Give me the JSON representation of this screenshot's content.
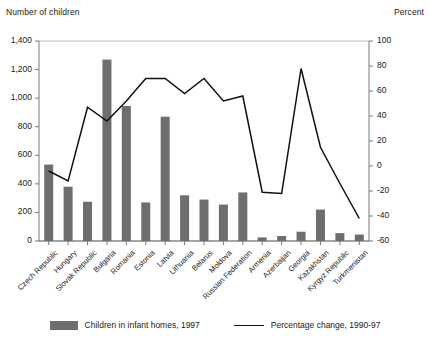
{
  "chart_data": {
    "type": "bar",
    "title": "",
    "subtitle": "",
    "ylabel": "Number of children",
    "y2label": "Percent",
    "xlabel": "",
    "grid": false,
    "legend_position": "bottom",
    "categories": [
      "Czech Republic",
      "Hungary",
      "Slovak Republic",
      "Bulgaria",
      "Romania",
      "Estonia",
      "Latvia",
      "Lithuania",
      "Belarus",
      "Moldova",
      "Russian Federation",
      "Armenia",
      "Azerbaijan",
      "Georgia",
      "Kazakhstan",
      "Kyrgyz Republic",
      "Turkmenistan"
    ],
    "ylim": [
      0,
      1400
    ],
    "yticks": [
      "0",
      "200",
      "400",
      "600",
      "800",
      "1,000",
      "1,200",
      "1,400"
    ],
    "y2lim": [
      -60,
      100
    ],
    "y2ticks": [
      "-60",
      "-40",
      "-20",
      "0",
      "20",
      "40",
      "60",
      "80",
      "100"
    ],
    "series": [
      {
        "name": "Children in infant homes, 1997",
        "type": "bar",
        "axis": "left",
        "color": "#6e6e6e",
        "values": [
          535,
          380,
          275,
          1270,
          945,
          270,
          870,
          320,
          290,
          255,
          340,
          25,
          35,
          65,
          220,
          55,
          45
        ]
      },
      {
        "name": "Percentage change, 1990-97",
        "type": "line",
        "axis": "right",
        "color": "#111111",
        "values": [
          -4,
          -12,
          47,
          36,
          52,
          70,
          70,
          58,
          70,
          52,
          56,
          -21,
          -22,
          78,
          15,
          -14,
          -42
        ]
      }
    ]
  },
  "legend": {
    "bar_label": "Children in infant homes, 1997",
    "line_label": "Percentage change, 1990-97"
  }
}
